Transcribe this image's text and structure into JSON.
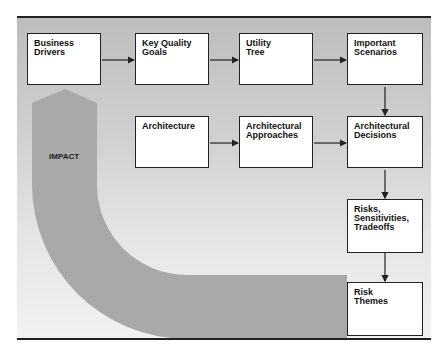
{
  "diagram": {
    "impact_label": "IMPACT",
    "colors": {
      "panel": "#c8c8c8",
      "impact_arrow": "#a9a9a9",
      "box_fill": "#ffffff",
      "line": "#222222"
    },
    "boxes": [
      {
        "id": "business-drivers",
        "label": "Business\nDrivers"
      },
      {
        "id": "key-quality-goals",
        "label": "Key Quality\nGoals"
      },
      {
        "id": "utility-tree",
        "label": "Utility\nTree"
      },
      {
        "id": "important-scenarios",
        "label": "Important\nScenarios"
      },
      {
        "id": "architecture",
        "label": "Architecture"
      },
      {
        "id": "architectural-approaches",
        "label": "Architectural\nApproaches"
      },
      {
        "id": "architectural-decisions",
        "label": "Architectural\nDecisions"
      },
      {
        "id": "risks",
        "label": "Risks,\nSensitivities,\nTradeoffs"
      },
      {
        "id": "risk-themes",
        "label": "Risk\nThemes"
      }
    ],
    "edges": [
      [
        "business-drivers",
        "key-quality-goals"
      ],
      [
        "key-quality-goals",
        "utility-tree"
      ],
      [
        "utility-tree",
        "important-scenarios"
      ],
      [
        "important-scenarios",
        "architectural-decisions"
      ],
      [
        "architecture",
        "architectural-approaches"
      ],
      [
        "architectural-approaches",
        "architectural-decisions"
      ],
      [
        "architectural-decisions",
        "risks"
      ],
      [
        "risks",
        "risk-themes"
      ],
      [
        "risk-themes",
        "business-drivers"
      ]
    ]
  }
}
